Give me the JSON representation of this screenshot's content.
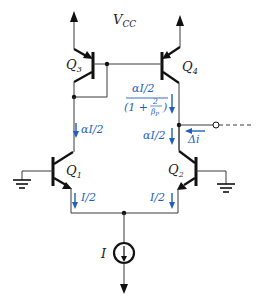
{
  "diagram": {
    "type": "circuit-schematic",
    "supply_label": "V",
    "supply_sub": "CC",
    "colors": {
      "wire": "#3a3a3a",
      "device": "#111111",
      "annotation": "#1f5fbf"
    },
    "transistors": [
      {
        "id": "Q3",
        "label": "Q",
        "sub": "3",
        "type": "PNP"
      },
      {
        "id": "Q4",
        "label": "Q",
        "sub": "4",
        "type": "PNP"
      },
      {
        "id": "Q1",
        "label": "Q",
        "sub": "1",
        "type": "NPN"
      },
      {
        "id": "Q2",
        "label": "Q",
        "sub": "2",
        "type": "NPN"
      }
    ],
    "current_source": {
      "label": "I"
    },
    "annotations": {
      "q4_current_num": "αI/2",
      "q4_current_den_open": "(1 +",
      "q4_current_den_frac_num": "2",
      "q4_current_den_frac_den": "β",
      "q4_current_den_frac_den_sub": "P",
      "q4_current_den_close": ")",
      "q1_collector_current": "αI/2",
      "q2_collector_current": "αI/2",
      "q1_emitter_current": "I/2",
      "q2_emitter_current": "I/2",
      "output_current": "Δi"
    }
  }
}
